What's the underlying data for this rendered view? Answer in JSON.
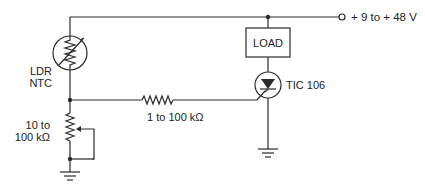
{
  "diagram": {
    "type": "circuit-schematic",
    "colors": {
      "line": "#2a2a2a",
      "text": "#222222",
      "background": "#ffffff"
    },
    "supply": {
      "label": "+ 9 to + 48 V",
      "terminal": "open-circle"
    },
    "components": {
      "sensor": {
        "label_line1": "LDR",
        "label_line2": "NTC",
        "symbol": "variable-resistor-in-circle"
      },
      "potentiometer": {
        "label_line1": "10 to",
        "label_line2": "100 kΩ",
        "symbol": "potentiometer-wired-as-rheostat"
      },
      "gate_resistor": {
        "label": "1 to 100 kΩ",
        "symbol": "resistor"
      },
      "load": {
        "label": "LOAD",
        "symbol": "box"
      },
      "scr": {
        "label": "TIC 106",
        "symbol": "thyristor-in-circle"
      }
    },
    "grounds": [
      "left-ground",
      "scr-ground"
    ],
    "junctions": [
      "top-rail-load-junction",
      "sensor-pot-junction",
      "pot-wiper-junction"
    ]
  }
}
